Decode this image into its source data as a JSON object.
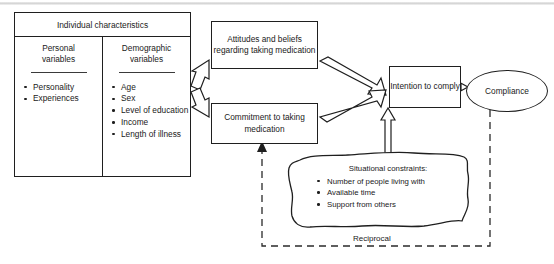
{
  "diagram": {
    "individual_characteristics": {
      "header": "Individual characteristics",
      "columns": [
        {
          "header_line1": "Personal",
          "header_line2": "variables",
          "items": [
            "Personality",
            "Experiences"
          ]
        },
        {
          "header_line1": "Demographic",
          "header_line2": "variables",
          "items": [
            "Age",
            "Sex",
            "Level of education",
            "Income",
            "Length of illness"
          ]
        }
      ]
    },
    "nodes": {
      "attitudes": "Attitudes and beliefs regarding taking medication",
      "commitment": "Commitment to taking medication",
      "intention": "Intention to comply",
      "compliance": "Compliance"
    },
    "cloud": {
      "header": "Situational constraints:",
      "items": [
        "Number of people living with",
        "Available time",
        "Support from others"
      ]
    },
    "feedback_label": "Reciprocal",
    "colors": {
      "stroke": "#1f1f1f",
      "background": "#ffffff",
      "dashed": "#2a2a2a"
    }
  }
}
